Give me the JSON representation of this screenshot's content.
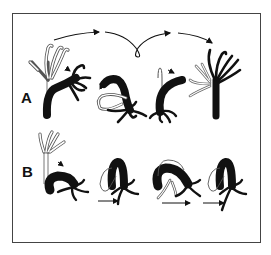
{
  "figure": {
    "type": "scientific-illustration",
    "rows": [
      {
        "label": "A",
        "description": "Somersaulting: animal bends, attaches tentacles, flips basal disc over and stands upright again",
        "stages": 4,
        "arrows": [
          "curved arrow stage 1 to 2",
          "looping arrow stage 2 to 3",
          "curved arrow stage 3 to 4"
        ]
      },
      {
        "label": "B",
        "description": "Inchworm-like looping: animal bends, attaches tentacles, moves base forward",
        "stages": 4,
        "arrows": [
          "forward arrow under stage 2",
          "forward arrow under stage 3",
          "forward arrow under stage 4"
        ]
      }
    ],
    "colors": {
      "body": "#111111",
      "outline_previous_position": "#555555",
      "frame": "#444444",
      "background": "#ffffff"
    }
  }
}
